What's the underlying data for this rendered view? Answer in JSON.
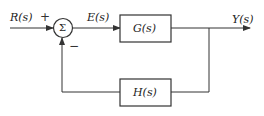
{
  "diagram": {
    "type": "feedback-control-block-diagram",
    "input_label": "R(s)",
    "error_label": "E(s)",
    "output_label": "Y(s)",
    "summing_junction": {
      "symbol": "Σ",
      "plus_sign": "+",
      "minus_sign": "−"
    },
    "forward_block": {
      "label": "G(s)"
    },
    "feedback_block": {
      "label": "H(s)"
    }
  }
}
